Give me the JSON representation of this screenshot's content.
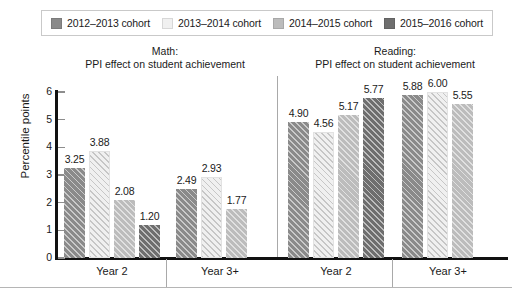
{
  "legend": {
    "items": [
      {
        "label": "2012–2013 cohort",
        "color": "#8a8a8a",
        "name": "legend-swatch-2012-2013"
      },
      {
        "label": "2013–2014 cohort",
        "color": "#f0f0f0",
        "name": "legend-swatch-2013-2014"
      },
      {
        "label": "2014–2015 cohort",
        "color": "#bcbcbc",
        "name": "legend-swatch-2014-2015"
      },
      {
        "label": "2015–2016 cohort",
        "color": "#6e6e6e",
        "name": "legend-swatch-2015-2016"
      }
    ]
  },
  "panels": [
    {
      "title_line1": "Math:",
      "title_line2": "PPI effect on student achievement",
      "groups": [
        {
          "label": "Year 2"
        },
        {
          "label": "Year 3+"
        }
      ]
    },
    {
      "title_line1": "Reading:",
      "title_line2": "PPI effect on student achievement",
      "groups": [
        {
          "label": "Year 2"
        },
        {
          "label": "Year 3+"
        }
      ]
    }
  ],
  "yaxis": {
    "title": "Percentile points",
    "ticks": [
      "0",
      "1",
      "2",
      "3",
      "4",
      "5",
      "6"
    ]
  },
  "chart_data": {
    "type": "bar",
    "title": "PPI effect on student achievement",
    "xlabel": "",
    "ylabel": "Percentile points",
    "ylim": [
      0,
      6
    ],
    "ytick_labels": [
      "0",
      "1",
      "2",
      "3",
      "4",
      "5",
      "6"
    ],
    "grid": false,
    "legend_position": "top",
    "panels": [
      {
        "name": "Math",
        "title": "Math: PPI effect on student achievement",
        "categories": [
          "Year 2",
          "Year 3+"
        ],
        "series": [
          {
            "name": "2012–2013 cohort",
            "color": "#8a8a8a",
            "values": [
              3.25,
              2.49
            ]
          },
          {
            "name": "2013–2014 cohort",
            "color": "#f0f0f0",
            "values": [
              3.88,
              2.93
            ]
          },
          {
            "name": "2014–2015 cohort",
            "color": "#bcbcbc",
            "values": [
              2.08,
              1.77
            ]
          },
          {
            "name": "2015–2016 cohort",
            "color": "#6e6e6e",
            "values": [
              1.2,
              null
            ]
          }
        ]
      },
      {
        "name": "Reading",
        "title": "Reading: PPI effect on student achievement",
        "categories": [
          "Year 2",
          "Year 3+"
        ],
        "series": [
          {
            "name": "2012–2013 cohort",
            "color": "#8a8a8a",
            "values": [
              4.9,
              5.88
            ]
          },
          {
            "name": "2013–2014 cohort",
            "color": "#f0f0f0",
            "values": [
              4.56,
              6.0
            ]
          },
          {
            "name": "2014–2015 cohort",
            "color": "#bcbcbc",
            "values": [
              5.17,
              5.55
            ]
          },
          {
            "name": "2015–2016 cohort",
            "color": "#6e6e6e",
            "values": [
              5.77,
              null
            ]
          }
        ]
      }
    ],
    "bars": [
      {
        "panel": "Math",
        "group": "Year 2",
        "series": "2012–2013 cohort",
        "value": 3.25,
        "label": "3.25"
      },
      {
        "panel": "Math",
        "group": "Year 2",
        "series": "2013–2014 cohort",
        "value": 3.88,
        "label": "3.88"
      },
      {
        "panel": "Math",
        "group": "Year 2",
        "series": "2014–2015 cohort",
        "value": 2.08,
        "label": "2.08"
      },
      {
        "panel": "Math",
        "group": "Year 2",
        "series": "2015–2016 cohort",
        "value": 1.2,
        "label": "1.20"
      },
      {
        "panel": "Math",
        "group": "Year 3+",
        "series": "2012–2013 cohort",
        "value": 2.49,
        "label": "2.49"
      },
      {
        "panel": "Math",
        "group": "Year 3+",
        "series": "2013–2014 cohort",
        "value": 2.93,
        "label": "2.93"
      },
      {
        "panel": "Math",
        "group": "Year 3+",
        "series": "2014–2015 cohort",
        "value": 1.77,
        "label": "1.77"
      },
      {
        "panel": "Reading",
        "group": "Year 2",
        "series": "2012–2013 cohort",
        "value": 4.9,
        "label": "4.90"
      },
      {
        "panel": "Reading",
        "group": "Year 2",
        "series": "2013–2014 cohort",
        "value": 4.56,
        "label": "4.56"
      },
      {
        "panel": "Reading",
        "group": "Year 2",
        "series": "2014–2015 cohort",
        "value": 5.17,
        "label": "5.17"
      },
      {
        "panel": "Reading",
        "group": "Year 2",
        "series": "2015–2016 cohort",
        "value": 5.77,
        "label": "5.77"
      },
      {
        "panel": "Reading",
        "group": "Year 3+",
        "series": "2012–2013 cohort",
        "value": 5.88,
        "label": "5.88"
      },
      {
        "panel": "Reading",
        "group": "Year 3+",
        "series": "2013–2014 cohort",
        "value": 6.0,
        "label": "6.00"
      },
      {
        "panel": "Reading",
        "group": "Year 3+",
        "series": "2014–2015 cohort",
        "value": 5.55,
        "label": "5.55"
      }
    ]
  }
}
